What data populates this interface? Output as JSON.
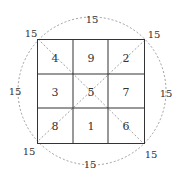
{
  "diagram": {
    "magic_sum": "15",
    "grid": [
      [
        "4",
        "9",
        "2"
      ],
      [
        "3",
        "5",
        "7"
      ],
      [
        "8",
        "1",
        "6"
      ]
    ],
    "cells": {
      "r0c0": "4",
      "r0c1": "9",
      "r0c2": "2",
      "r1c0": "3",
      "r1c1": "5",
      "r1c2": "7",
      "r2c0": "8",
      "r2c1": "1",
      "r2c2": "6"
    },
    "sum_labels": {
      "top": "15",
      "bottom": "15",
      "left": "15",
      "right": "15",
      "top_left": "15",
      "top_right": "15",
      "bottom_left": "15",
      "bottom_right": "15"
    },
    "colors": {
      "grid_line": "#333333",
      "dashed_line": "#888888",
      "text": "#333333"
    }
  }
}
